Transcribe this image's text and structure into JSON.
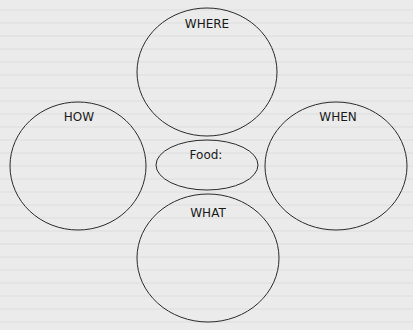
{
  "diagram": {
    "type": "concept-web",
    "background_color": "#ebebeb",
    "stroke_color": "#2a2a2a",
    "center": {
      "label": "Food:"
    },
    "nodes": [
      {
        "id": "where",
        "label": "WHERE"
      },
      {
        "id": "how",
        "label": "HOW"
      },
      {
        "id": "when",
        "label": "WHEN"
      },
      {
        "id": "what",
        "label": "WHAT"
      }
    ]
  }
}
